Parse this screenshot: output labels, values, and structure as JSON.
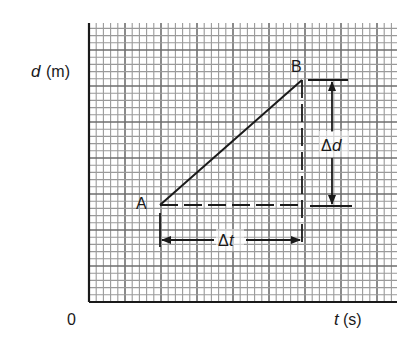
{
  "figure": {
    "kind": "distance-time graph showing gradient as Δd/Δt",
    "y_axis_label": {
      "symbol": "d",
      "unit": "(m)"
    },
    "x_axis_label": {
      "symbol": "t",
      "unit": "(s)"
    },
    "origin_label": "0",
    "points": [
      {
        "name": "A",
        "label": "A"
      },
      {
        "name": "B",
        "label": "B"
      }
    ],
    "delta_d_label": {
      "delta": "Δ",
      "symbol": "d"
    },
    "delta_t_label": {
      "delta": "Δ",
      "symbol": "t"
    },
    "colors": {
      "ink": "#1a1a1a",
      "grid_minor": "#9a9a9a",
      "grid_major": "#6e6e6e",
      "paper": "#ffffff"
    }
  },
  "chart_data": {
    "type": "line",
    "title": "",
    "xlabel": "t (s)",
    "ylabel": "d (m)",
    "grid": true,
    "axis_ticks": "none (only origin 0 labeled)",
    "series": [
      {
        "name": "segment AB",
        "points": [
          {
            "label": "A",
            "x": 0.23,
            "y": 0.35
          },
          {
            "label": "B",
            "x": 0.69,
            "y": 0.8
          }
        ]
      }
    ],
    "annotations": [
      {
        "type": "dashed-horizontal",
        "from": "A",
        "to": "below B",
        "note": "run"
      },
      {
        "type": "dashed-vertical",
        "from": "B",
        "to": "A level",
        "note": "rise"
      },
      {
        "type": "double-arrow-horizontal",
        "label": "Δt",
        "spans": "A.x to B.x"
      },
      {
        "type": "double-arrow-vertical",
        "label": "Δd",
        "spans": "A.y to B.y"
      }
    ]
  }
}
